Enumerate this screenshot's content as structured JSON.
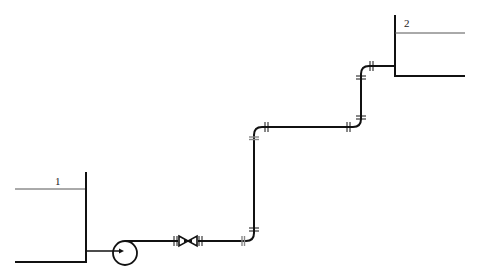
{
  "diagram": {
    "type": "piping-schematic",
    "colors": {
      "line": "#111111",
      "liquid_level": "#555555",
      "flange_gray": "#888888",
      "background": "#ffffff"
    },
    "tanks": [
      {
        "id": "tank-1",
        "label": "1"
      },
      {
        "id": "tank-2",
        "label": "2"
      }
    ],
    "components": [
      {
        "id": "pump",
        "kind": "centrifugal-pump"
      },
      {
        "id": "valve",
        "kind": "gate-valve"
      }
    ],
    "flange_count": 10,
    "elbow_count": 4
  }
}
